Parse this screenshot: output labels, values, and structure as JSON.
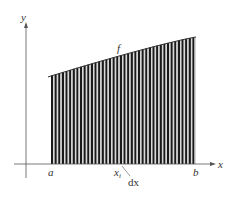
{
  "chart_data": {
    "type": "area",
    "title": "",
    "xlabel": "x",
    "ylabel": "y",
    "curve_label": "f",
    "tick_labels": {
      "a": "a",
      "b": "b",
      "xi": "x",
      "xi_sub": "i"
    },
    "annotation": "dx",
    "strips": 40,
    "curve": {
      "start_height_frac": 0.71,
      "end_height_frac": 1.0,
      "shape": "concave"
    },
    "grid": false,
    "legend": null
  },
  "colors": {
    "fill": "#1a1a1a",
    "gap": "#d8d8d8",
    "axis": "#555555",
    "text": "#333333"
  }
}
